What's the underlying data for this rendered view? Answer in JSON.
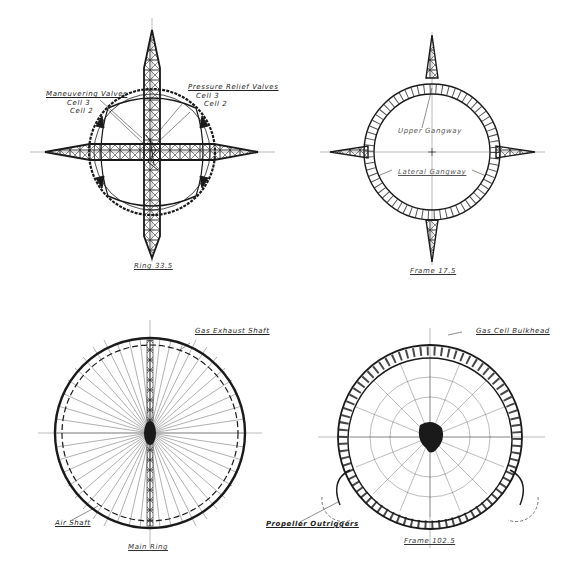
{
  "plate": {
    "colors": {
      "ink": "#1a1a1a",
      "paper": "#ffffff",
      "faint": "#888888"
    }
  },
  "drawings": [
    {
      "id": "ring-33-5",
      "caption": "Ring 33.5",
      "labels": {
        "maneuvering_valves": "Maneuvering Valves",
        "maneuvering_cell3": "Cell 3",
        "maneuvering_cell2": "Cell 2",
        "pressure_relief_valves": "Pressure Relief Valves",
        "pressure_cell3": "Cell 3",
        "pressure_cell2": "Cell 2"
      }
    },
    {
      "id": "frame-17-5",
      "caption": "Frame 17.5",
      "labels": {
        "upper_gangway": "Upper Gangway",
        "lateral_gangway": "Lateral Gangway"
      }
    },
    {
      "id": "main-ring",
      "caption": "Main Ring",
      "labels": {
        "gas_exhaust_shaft": "Gas Exhaust Shaft",
        "air_shaft": "Air Shaft"
      }
    },
    {
      "id": "frame-102-5",
      "caption": "Frame 102.5",
      "labels": {
        "gas_cell_bulkhead": "Gas Cell Bulkhead",
        "propeller_outriggers": "Propeller Outriggers"
      }
    }
  ]
}
